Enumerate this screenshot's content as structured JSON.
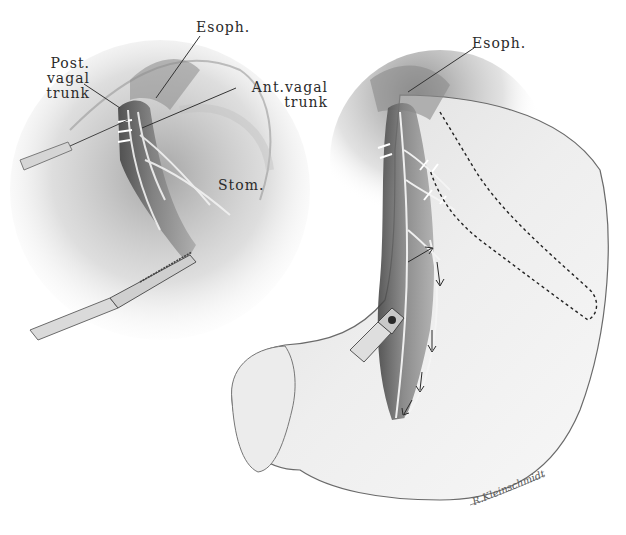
{
  "figure": {
    "left_panel": {
      "labels": {
        "esophagus": "Esoph.",
        "posterior_vagal_trunk": [
          "Post.",
          "vagal",
          "trunk"
        ],
        "anterior_vagal_trunk": [
          "Ant.vagal",
          "trunk"
        ],
        "stomach": "Stom."
      }
    },
    "right_panel": {
      "labels": {
        "esophagus": "Esoph."
      }
    },
    "signature": "R.Kleinschmidt"
  },
  "colors": {
    "background": "#ffffff",
    "ink": "#2a2a2a",
    "shade_dark": "#4a4a4a",
    "shade_mid": "#8e8e8e",
    "shade_light": "#d0d0d0"
  }
}
